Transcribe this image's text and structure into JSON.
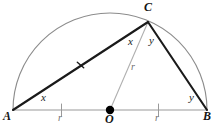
{
  "figure": {
    "width": 222,
    "height": 129
  },
  "colors": {
    "chord_stroke": "#1a1a1a",
    "arc_stroke": "#8c8c8c",
    "baseline_stroke": "#9a9a9a",
    "radius_stroke": "#b0b0b0",
    "center_dot": "#000000",
    "label_text": "#141414",
    "faint_text": "#6e6e6e",
    "background": "#ffffff"
  },
  "points": {
    "a": {
      "label": "A",
      "x": 13,
      "y": 110,
      "label_x": 5,
      "label_y": 112
    },
    "b": {
      "label": "B",
      "x": 207,
      "y": 110,
      "label_x": 203,
      "label_y": 112
    },
    "c": {
      "label": "C",
      "x": 148,
      "y": 22,
      "label_x": 145,
      "label_y": 2
    },
    "o": {
      "label": "O",
      "x": 110,
      "y": 110,
      "label_x": 106,
      "label_y": 113
    }
  },
  "labels": {
    "angle_a": {
      "text": "x",
      "x": 42,
      "y": 94
    },
    "angle_b": {
      "text": "y",
      "x": 190,
      "y": 94
    },
    "angle_c_left": {
      "text": "x",
      "x": 129,
      "y": 37
    },
    "angle_c_right": {
      "text": "y",
      "x": 150,
      "y": 36
    },
    "radius_oc": {
      "text": "r",
      "x": 131,
      "y": 63
    },
    "radius_ao": {
      "text": "r",
      "x": 58,
      "y": 113
    },
    "radius_ob": {
      "text": "r",
      "x": 157,
      "y": 113
    }
  },
  "elements": {
    "arc_name": "semicircle-arc",
    "diameter_name": "diameter-segment-ab",
    "chord_ac_name": "chord-segment-ac",
    "chord_cb_name": "chord-segment-cb",
    "radius_name": "radius-segment-oc",
    "tick_ac_name": "tick-mark-ac",
    "tick_ao_name": "tick-mark-ao",
    "tick_ob_name": "tick-mark-ob",
    "center_dot_name": "center-point-dot"
  }
}
